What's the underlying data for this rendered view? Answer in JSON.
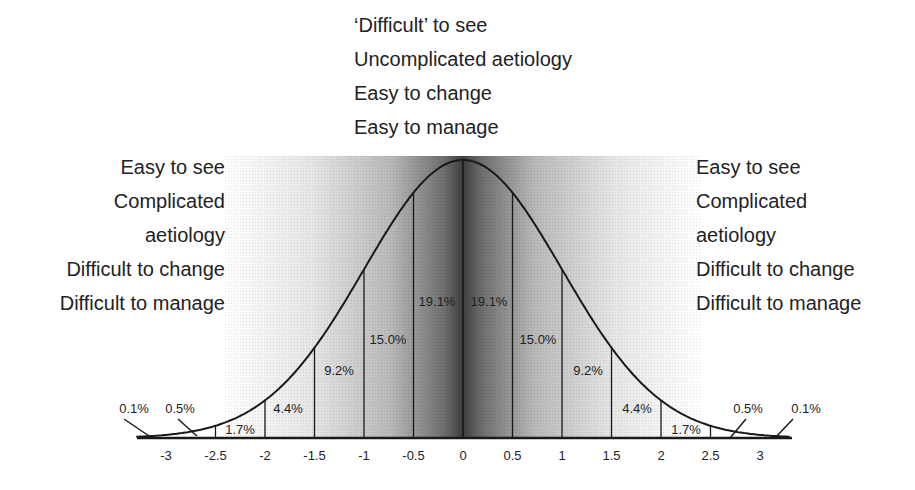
{
  "chart_data": {
    "type": "area",
    "title": "",
    "xlabel": "",
    "ylabel": "",
    "x_ticks": [
      "-3",
      "-2.5",
      "-2",
      "-1.5",
      "-1",
      "-0.5",
      "0",
      "0.5",
      "1",
      "1.5",
      "2",
      "2.5",
      "3"
    ],
    "x_range": [
      -3.3,
      3.3
    ],
    "grid": false,
    "segments": [
      {
        "from": "-inf",
        "to": -3,
        "label": "0.1%"
      },
      {
        "from": -3,
        "to": -2.5,
        "label": "0.5%"
      },
      {
        "from": -2.5,
        "to": -2,
        "label": "1.7%"
      },
      {
        "from": -2,
        "to": -1.5,
        "label": "4.4%"
      },
      {
        "from": -1.5,
        "to": -1,
        "label": "9.2%"
      },
      {
        "from": -1,
        "to": -0.5,
        "label": "15.0%"
      },
      {
        "from": -0.5,
        "to": 0,
        "label": "19.1%"
      },
      {
        "from": 0,
        "to": 0.5,
        "label": "19.1%"
      },
      {
        "from": 0.5,
        "to": 1,
        "label": "15.0%"
      },
      {
        "from": 1,
        "to": 1.5,
        "label": "9.2%"
      },
      {
        "from": 1.5,
        "to": 2,
        "label": "4.4%"
      },
      {
        "from": 2,
        "to": 2.5,
        "label": "1.7%"
      },
      {
        "from": 2.5,
        "to": 3,
        "label": "0.5%"
      },
      {
        "from": 3,
        "to": "inf",
        "label": "0.1%"
      }
    ],
    "annotations": {
      "center": [
        "'Difficult' to see",
        "Uncomplicated aetiology",
        "Easy to change",
        "Easy to manage"
      ],
      "left_tail": [
        "Easy to see",
        "Complicated",
        "aetiology",
        "Difficult to change",
        "Difficult to manage"
      ],
      "right_tail": [
        "Easy to see",
        "Complicated",
        "aetiology",
        "Difficult to change",
        "Difficult to manage"
      ]
    },
    "shading": "grey gradient darkest at mean, fading to white toward tails"
  },
  "labels": {
    "top": [
      "‘Difficult’ to see",
      "Uncomplicated aetiology",
      "Easy to change",
      "Easy to manage"
    ],
    "left": [
      "Easy to see",
      "Complicated",
      "aetiology",
      "Difficult to change",
      "Difficult to manage"
    ],
    "right": [
      "Easy to see",
      "Complicated",
      "aetiology",
      "Difficult to change",
      "Difficult to manage"
    ]
  },
  "colors": {
    "dark": "#3a3a3a",
    "light": "#ffffff",
    "line": "#1a1a1a",
    "text": "#222222"
  }
}
